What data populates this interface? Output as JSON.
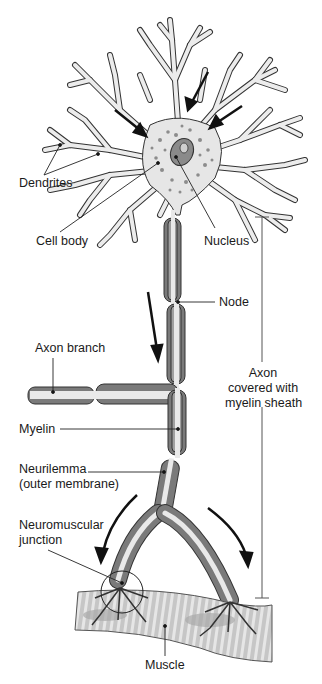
{
  "figure": {
    "colors": {
      "outline": "#2a2a2a",
      "cytoplasm": "#e6e6e6",
      "myelin": "#7a7a7a",
      "myelin_inner": "#a0a0a0",
      "axon_core": "#e9e9e9",
      "nucleus": "#8a8a8a",
      "muscle": "#c4c4c4",
      "muscle_stripe": "#e8e8e8",
      "arrow": "#111111"
    }
  },
  "labels": {
    "dendrites": "Dendrites",
    "cell_body": "Cell body",
    "nucleus": "Nucleus",
    "node": "Node",
    "axon_branch": "Axon branch",
    "axon_sheath_line1": "Axon",
    "axon_sheath_line2": "covered with",
    "axon_sheath_line3": "myelin sheath",
    "myelin": "Myelin",
    "neurilemma_line1": "Neurilemma",
    "neurilemma_line2": "(outer membrane)",
    "nmj_line1": "Neuromuscular",
    "nmj_line2": "junction",
    "muscle": "Muscle"
  }
}
